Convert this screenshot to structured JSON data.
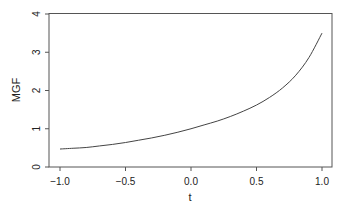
{
  "chart_data": {
    "type": "line",
    "title": "",
    "xlabel": "t",
    "ylabel": "MGF",
    "xlim": [
      -1.0,
      1.0
    ],
    "ylim": [
      0,
      4
    ],
    "x_ticks": [
      "-1.0",
      "-0.5",
      "0.0",
      "0.5",
      "1.0"
    ],
    "y_ticks": [
      "0",
      "1",
      "2",
      "3",
      "4"
    ],
    "grid": false,
    "legend": null,
    "series": [
      {
        "name": "MGF",
        "color": "#444444",
        "x": [
          -1.0,
          -0.9,
          -0.8,
          -0.7,
          -0.6,
          -0.5,
          -0.4,
          -0.3,
          -0.2,
          -0.1,
          0.0,
          0.1,
          0.2,
          0.3,
          0.4,
          0.5,
          0.6,
          0.7,
          0.8,
          0.9,
          1.0
        ],
        "y": [
          0.47,
          0.49,
          0.51,
          0.55,
          0.59,
          0.64,
          0.7,
          0.76,
          0.83,
          0.91,
          1.0,
          1.1,
          1.2,
          1.32,
          1.46,
          1.62,
          1.82,
          2.07,
          2.4,
          2.86,
          3.5
        ]
      }
    ]
  }
}
